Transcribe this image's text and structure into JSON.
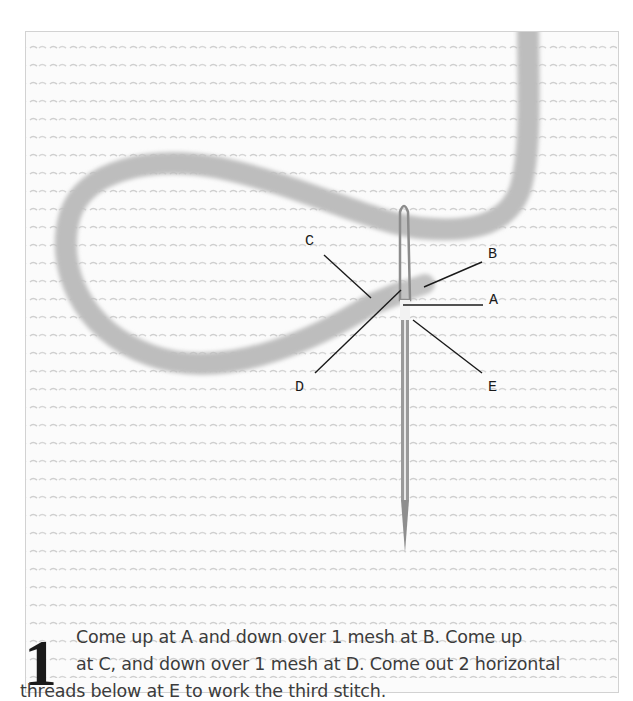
{
  "figure": {
    "colors": {
      "background": "#ffffff",
      "canvas": "#fbfbfb",
      "mesh": "#d4d4d4",
      "yarn": "#b9b9b9",
      "needle": "#8a8a8a",
      "leader_lines": "#1a1a1a",
      "caption_text": "#3c3c3c"
    },
    "labels": [
      {
        "id": "A",
        "text": "A"
      },
      {
        "id": "B",
        "text": "B"
      },
      {
        "id": "C",
        "text": "C"
      },
      {
        "id": "D",
        "text": "D"
      },
      {
        "id": "E",
        "text": "E"
      }
    ]
  },
  "instruction": {
    "step_number": "1",
    "line1": "Come up at A and down over 1 mesh at B. Come up",
    "line2": "at C, and down over 1 mesh at D. Come out 2 horizontal",
    "line3": "threads below at E to work the third stitch."
  }
}
